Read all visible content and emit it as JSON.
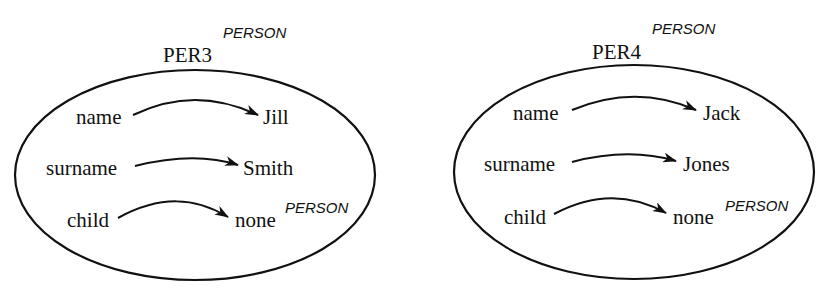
{
  "frames": [
    {
      "id": "PER3",
      "type": "PERSON",
      "slots": [
        {
          "attribute": "name",
          "value": "Jill",
          "value_type": ""
        },
        {
          "attribute": "surname",
          "value": "Smith",
          "value_type": ""
        },
        {
          "attribute": "child",
          "value": "none",
          "value_type": "PERSON"
        }
      ]
    },
    {
      "id": "PER4",
      "type": "PERSON",
      "slots": [
        {
          "attribute": "name",
          "value": "Jack",
          "value_type": ""
        },
        {
          "attribute": "surname",
          "value": "Jones",
          "value_type": ""
        },
        {
          "attribute": "child",
          "value": "none",
          "value_type": "PERSON"
        }
      ]
    }
  ],
  "colors": {
    "stroke": "#111111",
    "background": "#ffffff"
  }
}
